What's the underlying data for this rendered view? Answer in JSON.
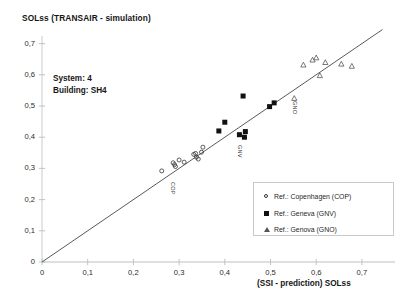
{
  "chart_data": {
    "type": "scatter",
    "title": "SOLss (TRANSAIR - simulation)",
    "xlabel": "(SSI - prediction) SOLss",
    "ylabel": "SOLss (TRANSAIR - simulation)",
    "xlim": [
      0,
      0.75
    ],
    "ylim": [
      0,
      0.75
    ],
    "grid": false,
    "legend_position": "inside-bottom-right",
    "xticks": [
      0,
      0.1,
      0.2,
      0.3,
      0.4,
      0.5,
      0.6,
      0.7
    ],
    "xtick_labels": [
      "0",
      "0,1",
      "0,2",
      "0,3",
      "0,4",
      "0,5",
      "0,6",
      "0,7"
    ],
    "yticks": [
      0,
      0.1,
      0.2,
      0.3,
      0.4,
      0.5,
      0.6,
      0.7
    ],
    "ytick_labels": [
      "0",
      "0,1",
      "0,2",
      "0,3",
      "0,4",
      "0,5",
      "0,6",
      "0,7"
    ],
    "reference_line": {
      "from": [
        0,
        0
      ],
      "to": [
        0.745,
        0.745
      ],
      "label": "y = x"
    },
    "annotations": [
      {
        "text": "System: 4",
        "x": 0.06,
        "y": 0.595
      },
      {
        "text": "Building: SH4",
        "x": 0.06,
        "y": 0.56
      }
    ],
    "point_labels": [
      {
        "text": "COP",
        "x": 0.285,
        "y": 0.265
      },
      {
        "text": "GNV",
        "x": 0.432,
        "y": 0.385
      },
      {
        "text": "GNO",
        "x": 0.552,
        "y": 0.525
      }
    ],
    "series": [
      {
        "name": "Ref.:  Copenhagen (COP)",
        "key": "COP",
        "marker": "open-circle",
        "color": "#333333",
        "points": [
          [
            0.262,
            0.292
          ],
          [
            0.287,
            0.318
          ],
          [
            0.29,
            0.312
          ],
          [
            0.292,
            0.306
          ],
          [
            0.3,
            0.327
          ],
          [
            0.311,
            0.32
          ],
          [
            0.332,
            0.345
          ],
          [
            0.336,
            0.348
          ],
          [
            0.338,
            0.336
          ],
          [
            0.342,
            0.33
          ],
          [
            0.349,
            0.352
          ],
          [
            0.352,
            0.368
          ]
        ]
      },
      {
        "name": "Ref.:  Geneva (GNV)",
        "key": "GNV",
        "marker": "filled-square",
        "color": "#111111",
        "points": [
          [
            0.387,
            0.42
          ],
          [
            0.4,
            0.448
          ],
          [
            0.432,
            0.408
          ],
          [
            0.44,
            0.532
          ],
          [
            0.443,
            0.4
          ],
          [
            0.445,
            0.418
          ],
          [
            0.498,
            0.498
          ],
          [
            0.508,
            0.51
          ]
        ]
      },
      {
        "name": "Ref.:  Genova (GNO)",
        "key": "GNO",
        "marker": "open-triangle",
        "color": "#555555",
        "points": [
          [
            0.552,
            0.525
          ],
          [
            0.572,
            0.632
          ],
          [
            0.592,
            0.648
          ],
          [
            0.6,
            0.655
          ],
          [
            0.608,
            0.598
          ],
          [
            0.62,
            0.64
          ],
          [
            0.655,
            0.635
          ],
          [
            0.678,
            0.628
          ]
        ]
      }
    ]
  },
  "legend": {
    "items": [
      {
        "label": "Ref.:  Copenhagen (COP)",
        "marker": "open-circle"
      },
      {
        "label": "Ref.:  Geneva (GNV)",
        "marker": "filled-square"
      },
      {
        "label": "Ref.:  Genova (GNO)",
        "marker": "open-triangle"
      }
    ]
  }
}
